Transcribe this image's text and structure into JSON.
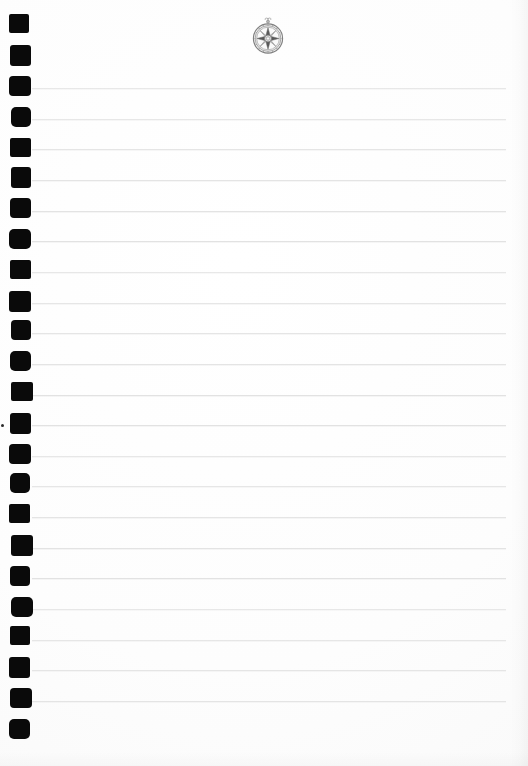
{
  "page": {
    "width": 528,
    "height": 766,
    "background_color": "#fdfdfd",
    "paper_type": "spiral-bound ruled notepad",
    "content_text": ""
  },
  "emblem": {
    "name": "compass-rose",
    "label": "Compass rose medallion",
    "description": "Circular grayscale compass rose / wind rose with eight-point star and small decorative finial",
    "color": "#8a8a8a",
    "x": 248,
    "y": 15,
    "width": 40,
    "height": 44
  },
  "binding": {
    "name": "spiral-binding-holes",
    "hole_color": "#0a0a0a",
    "count": 24,
    "first_y": 15,
    "spacing": 30.6,
    "x": 10,
    "width": 21,
    "height": 20
  },
  "rules": {
    "name": "ruled-lines",
    "line_color": "#e2e2e2",
    "count": 21,
    "first_y": 88,
    "spacing": 30.65,
    "x_start": 32,
    "x_end": 506
  },
  "artifacts": {
    "speck": {
      "x": 1,
      "y": 424,
      "size": 3
    }
  }
}
